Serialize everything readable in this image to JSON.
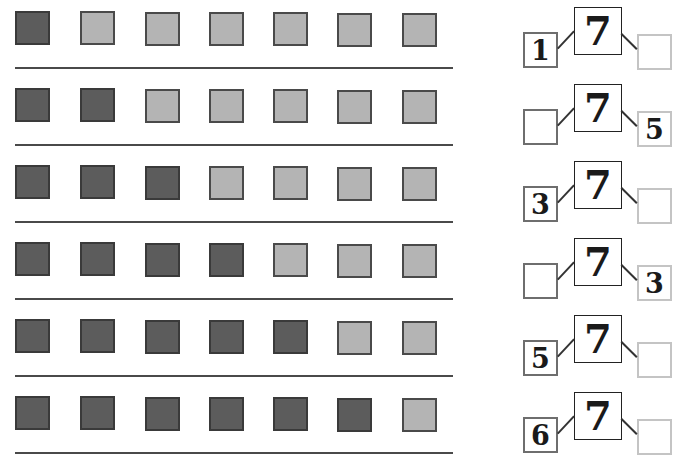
{
  "worksheet": {
    "total": "7",
    "colors": {
      "dark": "#5c5c5c",
      "light": "#b4b4b4",
      "left_box_border": "#6e6e6e",
      "right_box_border": "#c4c4c4"
    },
    "rows": [
      {
        "squares": [
          "dark",
          "light",
          "light",
          "light",
          "light",
          "light",
          "light"
        ],
        "left": "1",
        "whole": "7",
        "right": ""
      },
      {
        "squares": [
          "dark",
          "dark",
          "light",
          "light",
          "light",
          "light",
          "light"
        ],
        "left": "",
        "whole": "7",
        "right": "5"
      },
      {
        "squares": [
          "dark",
          "dark",
          "dark",
          "light",
          "light",
          "light",
          "light"
        ],
        "left": "3",
        "whole": "7",
        "right": ""
      },
      {
        "squares": [
          "dark",
          "dark",
          "dark",
          "dark",
          "light",
          "light",
          "light"
        ],
        "left": "",
        "whole": "7",
        "right": "3"
      },
      {
        "squares": [
          "dark",
          "dark",
          "dark",
          "dark",
          "dark",
          "light",
          "light"
        ],
        "left": "5",
        "whole": "7",
        "right": ""
      },
      {
        "squares": [
          "dark",
          "dark",
          "dark",
          "dark",
          "dark",
          "dark",
          "light"
        ],
        "left": "6",
        "whole": "7",
        "right": ""
      }
    ]
  }
}
